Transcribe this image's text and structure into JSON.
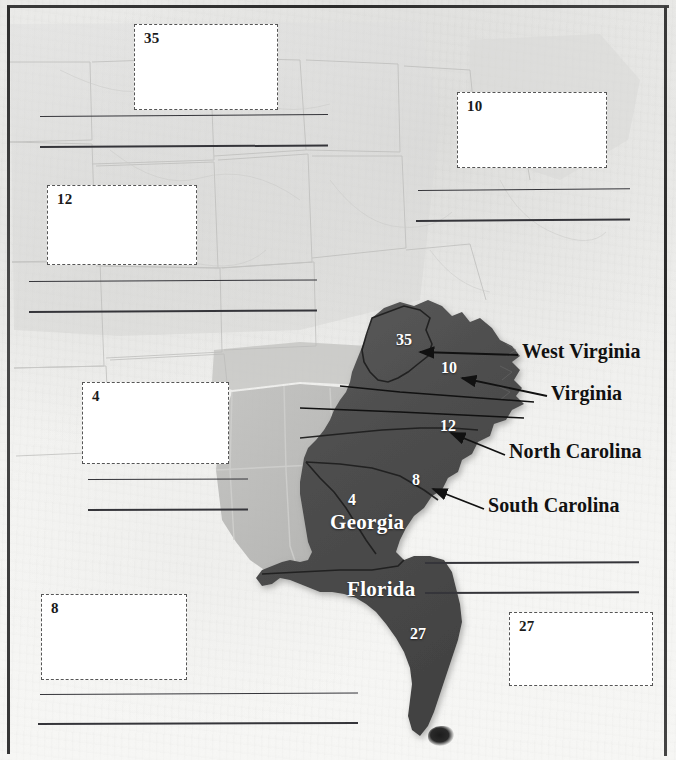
{
  "document": {
    "type": "map-worksheet",
    "title": "Southeast United States electoral vote labeling worksheet"
  },
  "colors": {
    "paper": "#eeeeec",
    "dark_state": "#4a4a4a",
    "mid_state": "#a8a8a6",
    "light_state": "#e2e2e0",
    "ink": "#111111",
    "white_label": "#ffffff",
    "rule_line": "#35353a",
    "box_border": "#555555"
  },
  "answer_boxes": [
    {
      "id": "box-35",
      "number": "35",
      "x": 134,
      "y": 24,
      "w": 144,
      "h": 86
    },
    {
      "id": "box-10",
      "number": "10",
      "x": 457,
      "y": 92,
      "w": 150,
      "h": 76
    },
    {
      "id": "box-12",
      "number": "12",
      "x": 47,
      "y": 185,
      "w": 150,
      "h": 80
    },
    {
      "id": "box-4",
      "number": "4",
      "x": 82,
      "y": 382,
      "w": 147,
      "h": 82
    },
    {
      "id": "box-8",
      "number": "8",
      "x": 41,
      "y": 594,
      "w": 146,
      "h": 86
    },
    {
      "id": "box-27",
      "number": "27",
      "x": 509,
      "y": 612,
      "w": 144,
      "h": 74
    }
  ],
  "ruled_lines": [
    {
      "id": "rule-1",
      "x": 40,
      "y": 116,
      "w": 288,
      "thickness": 1.2
    },
    {
      "id": "rule-2",
      "x": 40,
      "y": 146,
      "w": 288,
      "thickness": 2.0
    },
    {
      "id": "rule-3",
      "x": 418,
      "y": 190,
      "w": 212,
      "thickness": 1.4
    },
    {
      "id": "rule-4",
      "x": 416,
      "y": 220,
      "w": 214,
      "thickness": 2.0
    },
    {
      "id": "rule-5",
      "x": 29,
      "y": 281,
      "w": 288,
      "thickness": 1.4
    },
    {
      "id": "rule-6",
      "x": 29,
      "y": 311,
      "w": 288,
      "thickness": 2.0
    },
    {
      "id": "rule-7",
      "x": 88,
      "y": 479,
      "w": 160,
      "thickness": 1.4
    },
    {
      "id": "rule-8",
      "x": 88,
      "y": 509,
      "w": 160,
      "thickness": 2.0
    },
    {
      "id": "rule-9",
      "x": 425,
      "y": 562,
      "w": 214,
      "thickness": 1.6
    },
    {
      "id": "rule-10",
      "x": 425,
      "y": 592,
      "w": 214,
      "thickness": 2.0
    },
    {
      "id": "rule-11",
      "x": 40,
      "y": 694,
      "w": 318,
      "thickness": 1.4
    },
    {
      "id": "rule-12",
      "x": 38,
      "y": 723,
      "w": 320,
      "thickness": 2.0
    }
  ],
  "state_name_labels": [
    {
      "id": "label-west-virginia",
      "text": "West Virginia",
      "x": 522,
      "y": 352
    },
    {
      "id": "label-virginia",
      "text": "Virginia",
      "x": 551,
      "y": 394
    },
    {
      "id": "label-north-carolina",
      "text": "North Carolina",
      "x": 509,
      "y": 452
    },
    {
      "id": "label-south-carolina",
      "text": "South Carolina",
      "x": 488,
      "y": 506
    }
  ],
  "map_labels": [
    {
      "id": "map-label-georgia",
      "text": "Georgia",
      "x": 330,
      "y": 522,
      "size": "big"
    },
    {
      "id": "map-label-florida",
      "text": "Florida",
      "x": 347,
      "y": 589,
      "size": "big"
    }
  ],
  "map_numbers": [
    {
      "id": "map-number-35",
      "text": "35",
      "x": 396,
      "y": 340
    },
    {
      "id": "map-number-10",
      "text": "10",
      "x": 441,
      "y": 368
    },
    {
      "id": "map-number-12",
      "text": "12",
      "x": 440,
      "y": 426
    },
    {
      "id": "map-number-8",
      "text": "8",
      "x": 412,
      "y": 480
    },
    {
      "id": "map-number-4",
      "text": "4",
      "x": 348,
      "y": 500
    },
    {
      "id": "map-number-27",
      "text": "27",
      "x": 410,
      "y": 634
    }
  ],
  "leader_lines": [
    {
      "id": "leader-west-virginia",
      "from_x": 518,
      "from_y": 355,
      "to_x": 418,
      "to_y": 352
    },
    {
      "id": "leader-virginia",
      "from_x": 547,
      "from_y": 396,
      "to_x": 460,
      "to_y": 378
    },
    {
      "id": "leader-north-carolina",
      "from_x": 505,
      "from_y": 455,
      "to_x": 449,
      "to_y": 433
    },
    {
      "id": "leader-south-carolina",
      "from_x": 484,
      "from_y": 509,
      "to_x": 431,
      "to_y": 489
    },
    {
      "id": "leader-long-upper",
      "from_x": 532,
      "from_y": 400,
      "to_x": 340,
      "to_y": 386
    },
    {
      "id": "leader-long-lower",
      "from_x": 524,
      "from_y": 415,
      "to_x": 300,
      "to_y": 409
    }
  ]
}
